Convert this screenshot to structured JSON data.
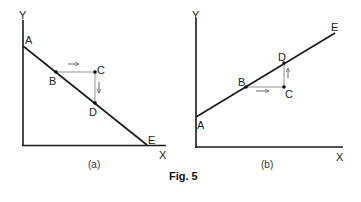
{
  "figure": {
    "title": "Fig. 5",
    "panels": [
      {
        "id": "a",
        "caption": "(a)",
        "axes": {
          "x_label": "X",
          "y_label": "Y"
        },
        "line": {
          "from": "A",
          "to": "E",
          "slope": "negative"
        },
        "points": {
          "A": "A",
          "B": "B",
          "C": "C",
          "D": "D",
          "E": "E"
        },
        "arrows": [
          {
            "from": "B",
            "to": "C",
            "direction": "right"
          },
          {
            "from": "C",
            "to": "D",
            "direction": "down"
          }
        ]
      },
      {
        "id": "b",
        "caption": "(b)",
        "axes": {
          "x_label": "X",
          "y_label": "Y"
        },
        "line": {
          "from": "A",
          "to": "E",
          "slope": "positive"
        },
        "points": {
          "A": "A",
          "B": "B",
          "C": "C",
          "D": "D",
          "E": "E"
        },
        "arrows": [
          {
            "from": "B",
            "to": "C",
            "direction": "right"
          },
          {
            "from": "C",
            "to": "D",
            "direction": "up"
          }
        ]
      }
    ]
  },
  "colors": {
    "ink": "#1a1a1a",
    "thin": "#555555",
    "background": "#ffffff"
  }
}
